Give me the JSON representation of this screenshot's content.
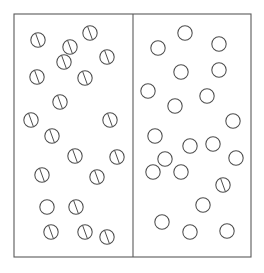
{
  "figure": {
    "name": "two-compartment-particle-diagram",
    "background_color": "#ffffff",
    "line_color": "#5a5a5a",
    "particle_stroke_color": "#4d4d4d",
    "particle_fill_color": "#ffffff",
    "width": 264,
    "height": 273
  },
  "container": {
    "x": 14,
    "y": 14,
    "width": 237,
    "height": 243,
    "divider_x": 133,
    "divider_top": 14,
    "divider_bottom": 257
  },
  "particle_style": {
    "radius": 7.2,
    "slash_angle_deg": 20,
    "slash_length_ratio": 0.92
  },
  "compartments": [
    {
      "id": "left-compartment",
      "label": "left",
      "particle_count": 20,
      "slashed_count": 19,
      "plain_count": 1,
      "particles": [
        {
          "cx": 38,
          "cy": 40,
          "slashed": true
        },
        {
          "cx": 70,
          "cy": 47,
          "slashed": true
        },
        {
          "cx": 90,
          "cy": 33,
          "slashed": true
        },
        {
          "cx": 107,
          "cy": 57,
          "slashed": true
        },
        {
          "cx": 37,
          "cy": 77,
          "slashed": true
        },
        {
          "cx": 85,
          "cy": 78,
          "slashed": true
        },
        {
          "cx": 60,
          "cy": 102,
          "slashed": true
        },
        {
          "cx": 31,
          "cy": 120,
          "slashed": true
        },
        {
          "cx": 110,
          "cy": 120,
          "slashed": true
        },
        {
          "cx": 52,
          "cy": 136,
          "slashed": true
        },
        {
          "cx": 75,
          "cy": 156,
          "slashed": true
        },
        {
          "cx": 117,
          "cy": 157,
          "slashed": true
        },
        {
          "cx": 42,
          "cy": 175,
          "slashed": true
        },
        {
          "cx": 97,
          "cy": 177,
          "slashed": true
        },
        {
          "cx": 47,
          "cy": 207,
          "slashed": false
        },
        {
          "cx": 76,
          "cy": 207,
          "slashed": true
        },
        {
          "cx": 51,
          "cy": 232,
          "slashed": true
        },
        {
          "cx": 85,
          "cy": 232,
          "slashed": true
        },
        {
          "cx": 107,
          "cy": 237,
          "slashed": true
        },
        {
          "cx": 64,
          "cy": 62,
          "slashed": true
        }
      ]
    },
    {
      "id": "right-compartment",
      "label": "right",
      "particle_count": 21,
      "slashed_count": 1,
      "plain_count": 20,
      "particles": [
        {
          "cx": 185,
          "cy": 33,
          "slashed": false
        },
        {
          "cx": 158,
          "cy": 48,
          "slashed": false
        },
        {
          "cx": 219,
          "cy": 44,
          "slashed": false
        },
        {
          "cx": 181,
          "cy": 72,
          "slashed": false
        },
        {
          "cx": 219,
          "cy": 70,
          "slashed": false
        },
        {
          "cx": 148,
          "cy": 91,
          "slashed": false
        },
        {
          "cx": 175,
          "cy": 106,
          "slashed": false
        },
        {
          "cx": 207,
          "cy": 96,
          "slashed": false
        },
        {
          "cx": 233,
          "cy": 121,
          "slashed": false
        },
        {
          "cx": 155,
          "cy": 136,
          "slashed": false
        },
        {
          "cx": 190,
          "cy": 146,
          "slashed": false
        },
        {
          "cx": 213,
          "cy": 144,
          "slashed": false
        },
        {
          "cx": 153,
          "cy": 172,
          "slashed": false
        },
        {
          "cx": 181,
          "cy": 172,
          "slashed": false
        },
        {
          "cx": 223,
          "cy": 185,
          "slashed": true
        },
        {
          "cx": 203,
          "cy": 205,
          "slashed": false
        },
        {
          "cx": 162,
          "cy": 222,
          "slashed": false
        },
        {
          "cx": 190,
          "cy": 232,
          "slashed": false
        },
        {
          "cx": 227,
          "cy": 231,
          "slashed": false
        },
        {
          "cx": 165,
          "cy": 159,
          "slashed": false
        },
        {
          "cx": 236,
          "cy": 158,
          "slashed": false
        }
      ]
    }
  ]
}
